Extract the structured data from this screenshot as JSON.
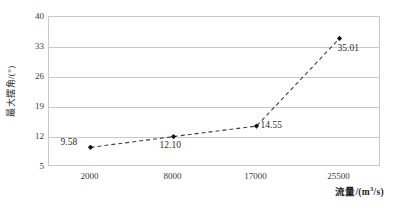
{
  "chart_data": {
    "type": "line",
    "title": "",
    "subtitle": "",
    "categories": [
      "2000",
      "8000",
      "17000",
      "25500"
    ],
    "values": [
      9.58,
      12.1,
      14.55,
      35.01
    ],
    "point_labels": [
      "9.58",
      "12.10",
      "14.55",
      "35.01"
    ],
    "xlabel": "流量/(m³/s)",
    "xlabel_main": "流量/(m",
    "xlabel_sup": "3",
    "xlabel_tail": "/s)",
    "ylabel": "最大摆角/(°)",
    "ylim": [
      5,
      40
    ],
    "yticks": [
      "5",
      "12",
      "19",
      "26",
      "33",
      "40"
    ],
    "ytick_values": [
      5,
      12,
      19,
      26,
      33,
      40
    ],
    "grid": true,
    "grid_axis": "y",
    "legend": "none",
    "series": [
      {
        "name": "最大摆角",
        "values": [
          9.58,
          12.1,
          14.55,
          35.01
        ],
        "line_style": "dashed",
        "line_color": "#3f3f3f",
        "marker": "diamond",
        "marker_color": "#111111"
      }
    ],
    "colors": {
      "line": "#3f3f3f",
      "marker": "#111111",
      "grid": "#c9c9c9",
      "border": "#c9c9c9",
      "text": "#2b2b2b",
      "background": "#ffffff"
    }
  }
}
